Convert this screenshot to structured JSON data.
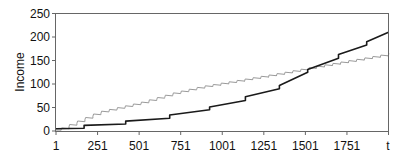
{
  "chart_data": {
    "type": "line",
    "title": "",
    "xlabel": "t",
    "ylabel": "Income",
    "xlim": [
      1,
      2001
    ],
    "ylim": [
      0,
      250
    ],
    "grid": false,
    "legend": "none",
    "x_ticks": [
      "1",
      "251",
      "501",
      "751",
      "1001",
      "1251",
      "1501",
      "1751"
    ],
    "x_tick_values": [
      1,
      251,
      501,
      751,
      1001,
      1251,
      1501,
      1751
    ],
    "y_ticks": [
      "0",
      "50",
      "100",
      "150",
      "200",
      "250"
    ],
    "y_tick_values": [
      0,
      50,
      100,
      150,
      200,
      250
    ],
    "series": [
      {
        "name": "black step series",
        "color": "#1a1a1a",
        "width": 1.6,
        "style": "step",
        "points": [
          [
            1,
            5
          ],
          [
            170,
            6
          ],
          [
            170,
            12
          ],
          [
            420,
            15
          ],
          [
            420,
            21
          ],
          [
            685,
            27
          ],
          [
            685,
            34
          ],
          [
            925,
            45
          ],
          [
            925,
            51
          ],
          [
            1140,
            65
          ],
          [
            1140,
            73
          ],
          [
            1345,
            90
          ],
          [
            1345,
            97
          ],
          [
            1515,
            125
          ],
          [
            1515,
            131
          ],
          [
            1700,
            155
          ],
          [
            1700,
            163
          ],
          [
            1870,
            183
          ],
          [
            1870,
            190
          ],
          [
            2001,
            210
          ]
        ]
      },
      {
        "name": "gray sawtooth series",
        "color": "#9a9a9a",
        "width": 1,
        "style": "sawtooth",
        "trend": [
          [
            1,
            2
          ],
          [
            31,
            4
          ],
          [
            251,
            38
          ],
          [
            501,
            58
          ],
          [
            718,
            80
          ],
          [
            868,
            92
          ],
          [
            1001,
            100
          ],
          [
            1350,
            121
          ],
          [
            1560,
            135
          ],
          [
            2001,
            162
          ]
        ],
        "period": 48,
        "amplitude": 5
      }
    ]
  }
}
